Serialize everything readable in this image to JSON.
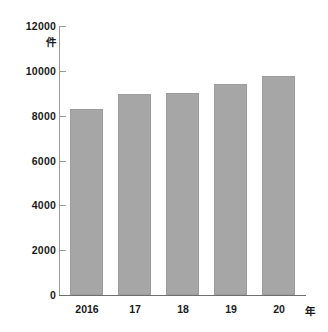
{
  "chart_data": {
    "type": "bar",
    "title": "",
    "subtitle": "",
    "categories": [
      "2016",
      "17",
      "18",
      "19",
      "20"
    ],
    "values": [
      8300,
      8950,
      9030,
      9430,
      9780
    ],
    "series": [
      {
        "name": "件数",
        "values": [
          8300,
          8950,
          9030,
          9430,
          9780
        ]
      }
    ],
    "xlabel": "年",
    "ylabel": "件",
    "ylim": [
      0,
      12000
    ],
    "ytick_values": [
      0,
      2000,
      4000,
      6000,
      8000,
      10000,
      12000
    ],
    "ytick_labels": [
      "0",
      "2000",
      "4000",
      "6000",
      "8000",
      "10000",
      "12000"
    ],
    "grid": false,
    "legend": null,
    "bar_color": "#a6a6a6",
    "axis_color": "#6f6f6f",
    "text_color": "#1a1a1a"
  },
  "axis": {
    "y_unit": "件",
    "x_unit": "年",
    "y_ticks": [
      {
        "label": "12000",
        "value": 12000
      },
      {
        "label": "10000",
        "value": 10000
      },
      {
        "label": "8000",
        "value": 8000
      },
      {
        "label": "6000",
        "value": 6000
      },
      {
        "label": "4000",
        "value": 4000
      },
      {
        "label": "2000",
        "value": 2000
      },
      {
        "label": "0",
        "value": 0
      }
    ],
    "x_ticks": [
      {
        "label": "2016"
      },
      {
        "label": "17"
      },
      {
        "label": "18"
      },
      {
        "label": "19"
      },
      {
        "label": "20"
      }
    ]
  }
}
